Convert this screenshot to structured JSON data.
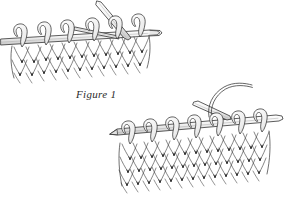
{
  "page": {
    "background_color": "#ffffff",
    "ink_color": "#2b2b2b",
    "width": 284,
    "height": 205,
    "illustration_style": "pen-and-ink line drawing"
  },
  "figures": [
    {
      "id": "figure-1",
      "caption": "Figure 1",
      "description": "Knitting needle held horizontally with a row of stitches hanging below; a second needle is inserted through a stitch and angles upward to the right.",
      "needle_count": 2,
      "stitch_columns": 6,
      "stitch_rows": 3
    },
    {
      "id": "figure-2",
      "caption": "Figure 2",
      "description": "Knitting needle holding a row of stitches with a working yarn strand curving up from the right; the knitted fabric hangs below in stockinette V pattern.",
      "needle_count": 2,
      "stitch_columns": 7,
      "stitch_rows": 4
    }
  ],
  "colors": {
    "paper": "#ffffff",
    "outline": "#333333",
    "shadow": "#777777",
    "deep_shadow": "#1a1a1a",
    "caption_text": "#2b2b2b"
  }
}
